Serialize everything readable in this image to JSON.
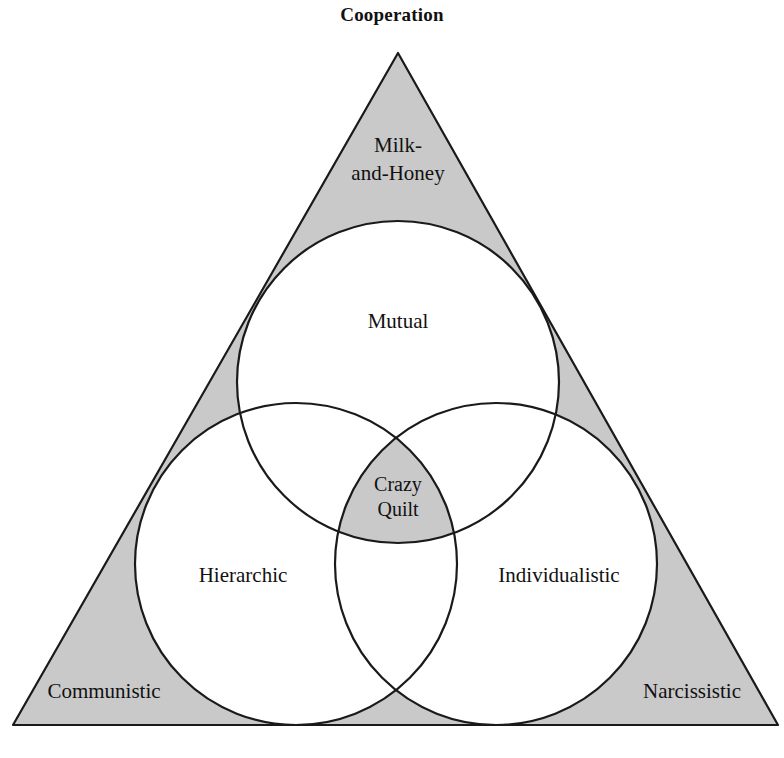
{
  "figure": {
    "title": "Cooperation",
    "type": "venn-triangle-diagram",
    "colors": {
      "shaded_fill": "#c9c9c9",
      "outline": "#1a1a1a",
      "circle_fill": "#ffffff",
      "background": "#ffffff",
      "text": "#111111"
    },
    "geometry": {
      "triangle": {
        "apex": [
          398,
          53
        ],
        "bottom_left": [
          13,
          725
        ],
        "bottom_right": [
          778,
          725
        ]
      },
      "circles": [
        {
          "name": "top",
          "cx": 398,
          "cy": 382,
          "r": 161
        },
        {
          "name": "left",
          "cx": 296,
          "cy": 564,
          "r": 161
        },
        {
          "name": "right",
          "cx": 496,
          "cy": 564,
          "r": 161
        }
      ]
    },
    "corner_labels": [
      {
        "id": "top-corner",
        "text": "Milk-and-Honey",
        "lines": [
          "Milk-",
          "and-Honey"
        ],
        "x": 398,
        "y": 152,
        "shaded": true
      },
      {
        "id": "bottom-left-corner",
        "text": "Communistic",
        "lines": [
          "Communistic"
        ],
        "x": 104,
        "y": 698,
        "shaded": true
      },
      {
        "id": "bottom-right-corner",
        "text": "Narcissistic",
        "lines": [
          "Narcissistic"
        ],
        "x": 692,
        "y": 698,
        "shaded": true
      }
    ],
    "circle_labels": [
      {
        "id": "top-circle",
        "text": "Mutual",
        "lines": [
          "Mutual"
        ],
        "x": 398,
        "y": 328,
        "shaded": false
      },
      {
        "id": "left-circle",
        "text": "Hierarchic",
        "lines": [
          "Hierarchic"
        ],
        "x": 243,
        "y": 582,
        "shaded": false
      },
      {
        "id": "right-circle",
        "text": "Individualistic",
        "lines": [
          "Individualistic"
        ],
        "x": 559,
        "y": 582,
        "shaded": false
      }
    ],
    "center_label": {
      "id": "center-intersection",
      "text": "Crazy Quilt",
      "lines": [
        "Crazy",
        "Quilt"
      ],
      "x": 398,
      "y": 491,
      "shaded": true
    }
  }
}
